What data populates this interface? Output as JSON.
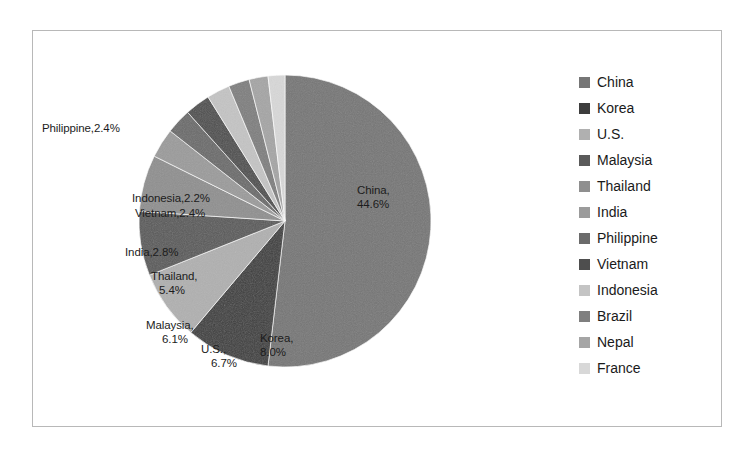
{
  "chart_data": {
    "type": "pie",
    "title": "",
    "subtitle": "",
    "legend_position": "right",
    "grid": false,
    "start_angle_deg": 0,
    "direction": "clockwise",
    "categories": [
      "China",
      "Korea",
      "U.S.",
      "Malaysia",
      "Thailand",
      "India",
      "Philippine",
      "Vietnam",
      "Indonesia",
      "Brazil",
      "Nepal",
      "France"
    ],
    "values": [
      44.6,
      8.0,
      6.7,
      6.1,
      5.4,
      2.8,
      2.4,
      2.4,
      2.2,
      2.0,
      1.8,
      1.6
    ],
    "value_unit": "%",
    "slice_fills": [
      "#767676",
      "#3d3d3d",
      "#b0b0b0",
      "#5a5a5a",
      "#8f8f8f",
      "#9b9b9b",
      "#6b6b6b",
      "#4e4e4e",
      "#c4c4c4",
      "#7f7f7f",
      "#a5a5a5",
      "#d8d8d8"
    ],
    "labels_shown": [
      {
        "category": "China",
        "text": "China,",
        "text2": "44.6%"
      },
      {
        "category": "Korea",
        "text": "Korea,",
        "text2": "8.0%"
      },
      {
        "category": "U.S.",
        "text": "U.S.,",
        "text2": "6.7%"
      },
      {
        "category": "Malaysia",
        "text": "Malaysia,",
        "text2": "6.1%"
      },
      {
        "category": "Thailand",
        "text": "Thailand,",
        "text2": "5.4%"
      },
      {
        "category": "India",
        "text": "India,2.8%",
        "text2": ""
      },
      {
        "category": "Vietnam",
        "text": "Vietnam,2.4%",
        "text2": ""
      },
      {
        "category": "Indonesia",
        "text": "Indonesia,2.2%",
        "text2": ""
      },
      {
        "category": "Philippine",
        "text": "Philippine,2.4%",
        "text2": ""
      }
    ],
    "xlabel": "",
    "ylabel": ""
  },
  "labels": {
    "china_l1": "China,",
    "china_l2": "44.6%",
    "korea_l1": "Korea,",
    "korea_l2": "8.0%",
    "us_l1": "U.S.,",
    "us_l2": "6.7%",
    "malaysia_l1": "Malaysia,",
    "malaysia_l2": "6.1%",
    "thailand_l1": "Thailand,",
    "thailand_l2": "5.4%",
    "india": "India,2.8%",
    "vietnam": "Vietnam,2.4%",
    "indonesia": "Indonesia,2.2%",
    "philippine": "Philippine,2.4%"
  },
  "legend": {
    "items": [
      {
        "label": "China",
        "color": "#767676"
      },
      {
        "label": "Korea",
        "color": "#3d3d3d"
      },
      {
        "label": "U.S.",
        "color": "#b0b0b0"
      },
      {
        "label": "Malaysia",
        "color": "#5a5a5a"
      },
      {
        "label": "Thailand",
        "color": "#8f8f8f"
      },
      {
        "label": "India",
        "color": "#9b9b9b"
      },
      {
        "label": "Philippine",
        "color": "#6b6b6b"
      },
      {
        "label": "Vietnam",
        "color": "#4e4e4e"
      },
      {
        "label": "Indonesia",
        "color": "#c4c4c4"
      },
      {
        "label": "Brazil",
        "color": "#7f7f7f"
      },
      {
        "label": "Nepal",
        "color": "#a5a5a5"
      },
      {
        "label": "France",
        "color": "#d8d8d8"
      }
    ]
  },
  "frame": {
    "border_color": "#b8b8b8",
    "background": "#ffffff"
  }
}
